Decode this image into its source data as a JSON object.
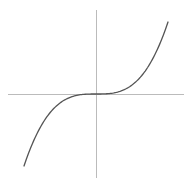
{
  "chart_data": {
    "type": "line",
    "title": "",
    "xlabel": "",
    "ylabel": "",
    "function": "y = x^3",
    "xlim": [
      -1.0,
      1.0
    ],
    "ylim": [
      -1.0,
      1.0
    ],
    "grid": false,
    "legend": null,
    "series": [
      {
        "name": "y = x^3",
        "x": [
          -1.0,
          -0.9,
          -0.8,
          -0.7,
          -0.6,
          -0.5,
          -0.4,
          -0.3,
          -0.2,
          -0.1,
          0.0,
          0.1,
          0.2,
          0.3,
          0.4,
          0.5,
          0.6,
          0.7,
          0.8,
          0.9,
          1.0
        ],
        "y": [
          -1.0,
          -0.729,
          -0.512,
          -0.343,
          -0.216,
          -0.125,
          -0.064,
          -0.027,
          -0.008,
          -0.001,
          0.0,
          0.001,
          0.008,
          0.027,
          0.064,
          0.125,
          0.216,
          0.343,
          0.512,
          0.729,
          1.0
        ],
        "color": "#555555"
      }
    ],
    "axes": {
      "color": "#bbbbbb",
      "origin_px": [
        96,
        94
      ],
      "x_axis_px": [
        8,
        184
      ],
      "y_axis_px": [
        10,
        178
      ],
      "unit_px": 72
    }
  }
}
